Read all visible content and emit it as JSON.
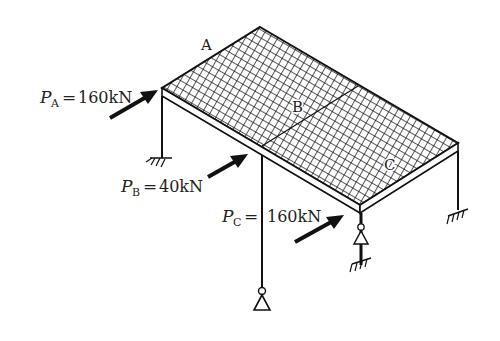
{
  "diagram": {
    "points": {
      "A": "A",
      "B": "B",
      "C": "C"
    },
    "loads": [
      {
        "symbol": "P",
        "subscript": "A",
        "equals": "=",
        "value": "160kN"
      },
      {
        "symbol": "P",
        "subscript": "B",
        "equals": "=",
        "value": "40kN"
      },
      {
        "symbol": "P",
        "subscript": "C",
        "equals": "=",
        "value": "160kN"
      }
    ],
    "supports": [
      {
        "type": "fixed",
        "location": "left-column"
      },
      {
        "type": "pinned",
        "location": "middle-column"
      },
      {
        "type": "pinned-on-fixed",
        "location": "front-column"
      },
      {
        "type": "fixed",
        "location": "right-column"
      }
    ],
    "colors": {
      "line": "#111111",
      "background": "#ffffff"
    }
  }
}
